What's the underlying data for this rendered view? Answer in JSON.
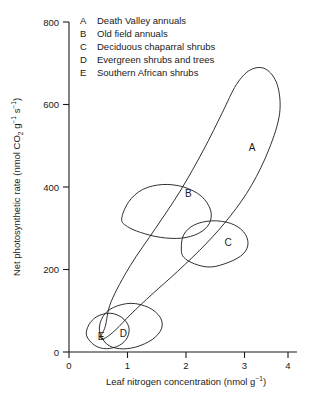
{
  "chart_data": {
    "type": "scatter",
    "title": "",
    "xlabel": "Leaf nitrogen concentration (nmol g⁻¹)",
    "ylabel": "Net photosynthetic rate (nmol CO₂ g⁻¹ s⁻¹)",
    "xlim": [
      0,
      4.3
    ],
    "ylim": [
      0,
      800
    ],
    "xticks": [
      0,
      1,
      2,
      3,
      4
    ],
    "yticks": [
      0,
      200,
      400,
      600,
      800
    ],
    "xtick_labels": [
      "0",
      "1",
      "2",
      "3",
      "4"
    ],
    "ytick_labels": [
      "0",
      "200",
      "400",
      "600",
      "800"
    ],
    "grid": false,
    "legend_position": "top-left-inside",
    "note": "Five hand-drawn data envelopes (convex outlines) enclosing species-group point clouds; no individual points plotted.",
    "series": [
      {
        "key": "A",
        "name": "Death Valley annuals",
        "label_xy": [
          3.13,
          495
        ],
        "envelope_extent": {
          "x": [
            0.55,
            3.62
          ],
          "y": [
            30,
            690
          ]
        },
        "centroid": [
          2.1,
          330
        ],
        "orientation_deg": 45,
        "description": "Long narrow envelope running diagonally from near origin up to high nitrogen / very high photosynthetic rate"
      },
      {
        "key": "B",
        "name": "Old field annuals",
        "label_xy": [
          2.04,
          385
        ],
        "envelope_extent": {
          "x": [
            0.85,
            2.45
          ],
          "y": [
            270,
            410
          ]
        },
        "centroid": [
          1.62,
          340
        ],
        "orientation_deg": 20,
        "description": "Mid-size tilted ellipse at intermediate nitrogen and rate"
      },
      {
        "key": "C",
        "name": "Deciduous chaparral shrubs",
        "label_xy": [
          2.72,
          265
        ],
        "envelope_extent": {
          "x": [
            1.9,
            3.1
          ],
          "y": [
            195,
            320
          ]
        },
        "centroid": [
          2.5,
          255
        ],
        "orientation_deg": 15,
        "description": "Smaller tilted ellipse overlapping lower right of B"
      },
      {
        "key": "D",
        "name": "Evergreen shrubs and trees",
        "label_xy": [
          0.93,
          45
        ],
        "envelope_extent": {
          "x": [
            0.5,
            1.6
          ],
          "y": [
            5,
            120
          ]
        },
        "centroid": [
          1.05,
          55
        ],
        "orientation_deg": 22,
        "description": "Low flat envelope hugging the x-axis at low nitrogen"
      },
      {
        "key": "E",
        "name": "Southern African shrubs",
        "label_xy": [
          0.55,
          38
        ],
        "envelope_extent": {
          "x": [
            0.3,
            1.05
          ],
          "y": [
            8,
            95
          ]
        },
        "centroid": [
          0.62,
          48
        ],
        "orientation_deg": 18,
        "description": "Smallest envelope nested at the very low end, overlapping D"
      }
    ]
  },
  "legend": {
    "items": [
      {
        "key": "A",
        "label": "Death Valley annuals"
      },
      {
        "key": "B",
        "label": "Old field annuals"
      },
      {
        "key": "C",
        "label": "Deciduous chaparral shrubs"
      },
      {
        "key": "D",
        "label": "Evergreen shrubs and trees"
      },
      {
        "key": "E",
        "label": "Southern African shrubs"
      }
    ]
  },
  "axes": {
    "x_title_main": "Leaf nitrogen concentration (nmol g",
    "x_title_sup": "−1",
    "x_title_tail": ")",
    "y_title_p1": "Net photosynthetic rate (nmol CO",
    "y_title_sub": "2",
    "y_title_p2": " g",
    "y_title_sup1": "−1",
    "y_title_p3": " s",
    "y_title_sup2": "−1",
    "y_title_tail": ")"
  },
  "colors": {
    "ink": "#1a1a1a",
    "background": "#ffffff"
  }
}
